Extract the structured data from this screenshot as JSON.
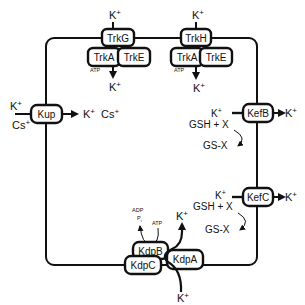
{
  "diagram": {
    "title": "",
    "membrane": {
      "shape": "rounded-rectangle"
    },
    "transporters": [
      {
        "id": "trkg",
        "label": "TrkG",
        "subunits": [
          "TrkA",
          "TrkE"
        ],
        "input": "K+",
        "output": "K+",
        "energy": "ATP"
      },
      {
        "id": "trkh",
        "label": "TrkH",
        "subunits": [
          "TrkA",
          "TrkE"
        ],
        "input": "K+",
        "output": "K+",
        "energy": "ATP"
      },
      {
        "id": "kup",
        "label": "Kup",
        "inputs": [
          "K+",
          "Cs+"
        ],
        "outputs": [
          "K+",
          "Cs+"
        ]
      },
      {
        "id": "kefb",
        "label": "KefB",
        "inside_label": "K+",
        "reaction": "GSH + X",
        "product": "GS-X",
        "output": "K+"
      },
      {
        "id": "kefc",
        "label": "KefC",
        "inside_label": "K+",
        "reaction": "GSH + X",
        "product": "GS-X",
        "output": "K+"
      },
      {
        "id": "kdp",
        "labels": [
          "KdpB",
          "KdpC",
          "KdpA"
        ],
        "input": "K+",
        "output": "K+",
        "energy_in": "ATP",
        "energy_out": [
          "ADP",
          "Pi"
        ]
      }
    ]
  },
  "labels": {
    "trkg": "TrkG",
    "trkh": "TrkH",
    "trka": "TrkA",
    "trke": "TrkE",
    "kup": "Kup",
    "kefb": "KefB",
    "kefc": "KefC",
    "kdpb": "KdpB",
    "kdpc": "KdpC",
    "kdpa": "KdpA",
    "k": "K",
    "plus": "+",
    "cs": "Cs",
    "atp": "ATP",
    "adp": "ADP",
    "p": "P",
    "i": "i",
    "gsh_x": "GSH + X",
    "gs_x": "GS-X"
  }
}
